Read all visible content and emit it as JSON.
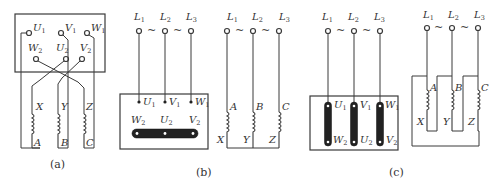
{
  "figure": {
    "panels": [
      {
        "id": "a",
        "caption": "(a)",
        "terminals_top": [
          "U1",
          "V1",
          "W1"
        ],
        "terminals_bottom": [
          "W2",
          "U2",
          "V2"
        ],
        "windings": [
          {
            "start": "X",
            "end": "A"
          },
          {
            "start": "Y",
            "end": "B"
          },
          {
            "start": "Z",
            "end": "C"
          }
        ]
      },
      {
        "id": "b",
        "caption": "(b)",
        "connection": "star (Y) on terminal block",
        "lines": [
          "L1",
          "L2",
          "L3"
        ],
        "terminals_top": [
          "U1",
          "V1",
          "W1"
        ],
        "terminals_bottom": [
          "W2",
          "U2",
          "V2"
        ],
        "equivalent_windings": [
          {
            "top": "A",
            "bottom": "X"
          },
          {
            "top": "B",
            "bottom": "Y"
          },
          {
            "top": "C",
            "bottom": "Z"
          }
        ]
      },
      {
        "id": "c",
        "caption": "(c)",
        "connection": "delta (Δ) on terminal block",
        "lines": [
          "L1",
          "L2",
          "L3"
        ],
        "terminals_top": [
          "U1",
          "V1",
          "W1"
        ],
        "terminals_bottom": [
          "W2",
          "U2",
          "V2"
        ],
        "equivalent_windings": [
          {
            "top": "A",
            "bottom": "X"
          },
          {
            "top": "B",
            "bottom": "Y"
          },
          {
            "top": "C",
            "bottom": "Z"
          }
        ]
      }
    ],
    "tilde": "~",
    "colors": {
      "line": "#3a3a3a",
      "bar": "#222222",
      "background": "#ffffff"
    }
  },
  "labels": {
    "U": "U",
    "V": "V",
    "W": "W",
    "s1": "1",
    "s2": "2",
    "s3": "3",
    "L": "L",
    "A": "A",
    "B": "B",
    "C": "C",
    "X": "X",
    "Y": "Y",
    "Z": "Z",
    "tilde": "~",
    "cap_a": "(a)",
    "cap_b": "(b)",
    "cap_c": "(c)"
  }
}
